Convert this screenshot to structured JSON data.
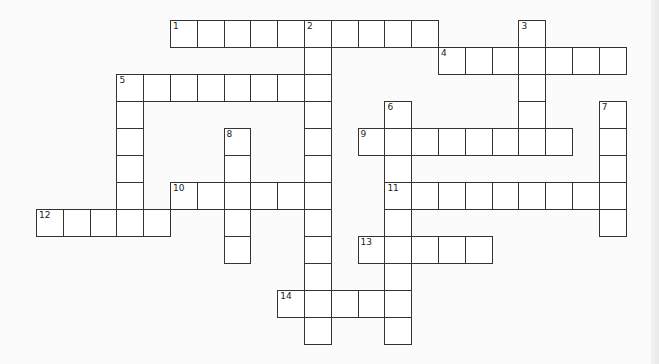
{
  "puzzle": {
    "type": "crossword",
    "grid": {
      "origin_x": 36,
      "origin_y": 20,
      "cell_w": 26.8,
      "cell_h": 27,
      "border_color": "#333333",
      "cell_fill": "#ffffff",
      "background": "#fbfbfb"
    },
    "entries": [
      {
        "number": "1",
        "direction": "across",
        "row": 0,
        "col": 5,
        "length": 10
      },
      {
        "number": "2",
        "direction": "down",
        "row": 0,
        "col": 10,
        "length": 12
      },
      {
        "number": "3",
        "direction": "down",
        "row": 0,
        "col": 18,
        "length": 5
      },
      {
        "number": "4",
        "direction": "across",
        "row": 1,
        "col": 15,
        "length": 7
      },
      {
        "number": "5",
        "direction": "across",
        "row": 2,
        "col": 3,
        "length": 8
      },
      {
        "number": "5",
        "direction": "down",
        "row": 2,
        "col": 3,
        "length": 6
      },
      {
        "number": "6",
        "direction": "down",
        "row": 3,
        "col": 13,
        "length": 9
      },
      {
        "number": "7",
        "direction": "down",
        "row": 3,
        "col": 21,
        "length": 5
      },
      {
        "number": "8",
        "direction": "down",
        "row": 4,
        "col": 7,
        "length": 5
      },
      {
        "number": "9",
        "direction": "across",
        "row": 4,
        "col": 12,
        "length": 8
      },
      {
        "number": "10",
        "direction": "across",
        "row": 6,
        "col": 5,
        "length": 6
      },
      {
        "number": "11",
        "direction": "across",
        "row": 6,
        "col": 13,
        "length": 9
      },
      {
        "number": "12",
        "direction": "across",
        "row": 7,
        "col": 0,
        "length": 5
      },
      {
        "number": "13",
        "direction": "across",
        "row": 8,
        "col": 12,
        "length": 5
      },
      {
        "number": "14",
        "direction": "across",
        "row": 10,
        "col": 9,
        "length": 5
      }
    ]
  }
}
